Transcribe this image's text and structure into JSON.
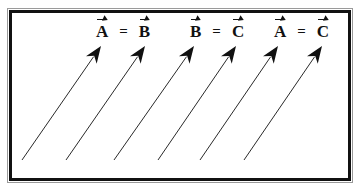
{
  "diagram": {
    "equations": [
      {
        "left": "A",
        "op": "=",
        "right": "B"
      },
      {
        "left": "B",
        "op": "=",
        "right": "C"
      },
      {
        "left": "A",
        "op": "=",
        "right": "C"
      }
    ],
    "arrows": [
      {
        "tail": [
          22,
          160
        ],
        "tip": [
          101,
          46
        ]
      },
      {
        "tail": [
          66,
          160
        ],
        "tip": [
          145,
          46
        ]
      },
      {
        "tail": [
          114,
          160
        ],
        "tip": [
          194,
          46
        ]
      },
      {
        "tail": [
          158,
          160
        ],
        "tip": [
          236,
          46
        ]
      },
      {
        "tail": [
          200,
          160
        ],
        "tip": [
          278,
          46
        ]
      },
      {
        "tail": [
          244,
          160
        ],
        "tip": [
          322,
          46
        ]
      }
    ],
    "colors": {
      "ink": "#111111",
      "background": "#ffffff",
      "frame": "#111111"
    }
  }
}
